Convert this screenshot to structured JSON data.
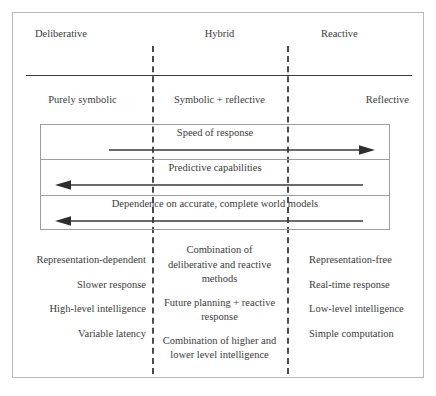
{
  "diagram": {
    "columns": [
      {
        "header": "Deliberative",
        "subtitle": "Purely symbolic"
      },
      {
        "header": "Hybrid",
        "subtitle": "Symbolic + reflective"
      },
      {
        "header": "Reactive",
        "subtitle": "Reflective"
      }
    ],
    "axes": [
      {
        "label": "Speed of response",
        "direction": "right"
      },
      {
        "label": "Predictive capabilities",
        "direction": "left"
      },
      {
        "label": "Dependence on accurate, complete world models",
        "direction": "left"
      }
    ],
    "attributes": {
      "deliberative": [
        "Representation-dependent",
        "Slower response",
        "High-level intelligence",
        "Variable latency"
      ],
      "hybrid": [
        "Combination of deliberative and reactive methods",
        "Future planning + reactive response",
        "Combination of higher and lower level intelligence"
      ],
      "reactive": [
        "Representation-free",
        "Real-time response",
        "Low-level intelligence",
        "Simple computation"
      ]
    },
    "colors": {
      "text": "#3b3b3b",
      "frame": "#b9b9b9",
      "divider": "#4a4a4a",
      "rule": "#3a3a3a",
      "arrow": "#3a3a3a",
      "box_border": "#9e9e9e"
    }
  }
}
